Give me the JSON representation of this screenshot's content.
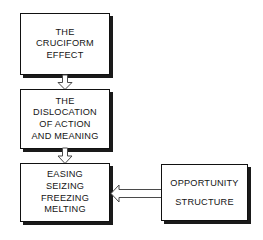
{
  "diagram": {
    "type": "flowchart",
    "title": "",
    "background_color": "#ffffff",
    "box_border_color": "#111111",
    "box_fill_color": "#ffffff",
    "box_shadow_color": "#1a1a1a",
    "arrow_outline_color": "#4a4a4a",
    "arrow_fill_color": "#ffffff",
    "nodes": [
      {
        "id": "cruciform",
        "lines": [
          "THE",
          "CRUCIFORM",
          "EFFECT"
        ]
      },
      {
        "id": "dislocation",
        "lines": [
          "THE",
          "DISLOCATION",
          "OF ACTION",
          "AND MEANING"
        ]
      },
      {
        "id": "easing",
        "lines": [
          "EASING",
          "SEIZING",
          "FREEZING",
          "MELTING"
        ]
      },
      {
        "id": "opportunity",
        "lines": [
          "OPPORTUNITY",
          "STRUCTURE"
        ]
      }
    ],
    "arrows": [
      {
        "id": "cruciform-to-dislocation",
        "from": "cruciform",
        "to": "dislocation",
        "direction": "down",
        "style": "hollow-block"
      },
      {
        "id": "dislocation-to-easing",
        "from": "dislocation",
        "to": "easing",
        "direction": "down",
        "style": "hollow-block"
      },
      {
        "id": "opportunity-to-easing",
        "from": "opportunity",
        "to": "easing",
        "direction": "left",
        "style": "hollow-block"
      }
    ]
  }
}
